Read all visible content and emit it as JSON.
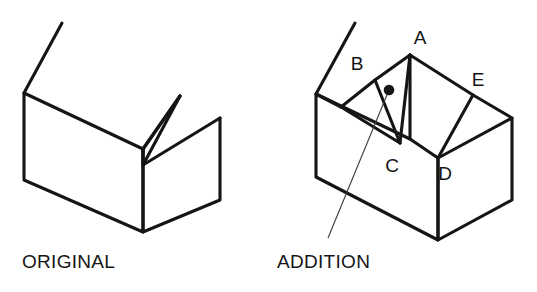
{
  "figure": {
    "background_color": "#ffffff",
    "line_color": "#151515",
    "width": 537,
    "height": 292
  },
  "panels": [
    {
      "id": "original",
      "caption": "ORIGINAL",
      "caption_x": 22,
      "caption_y": 268,
      "description": "Simple gable-roof house drawn in isometric projection",
      "shapes": {
        "roof_left_plane": "62,23 24,93 143,149 180,96",
        "roof_right_plane": "180,96 143,149 143,165 220,118",
        "left_wall": "24,93 24,180 143,232 143,149",
        "right_wall": "143,149 143,232 220,200 220,118",
        "gable_edge": "180,96 143,165"
      }
    },
    {
      "id": "addition",
      "caption": "ADDITION",
      "caption_x": 277,
      "caption_y": 268,
      "description": "Same house with a shed/gable addition cut into the front roof slope",
      "shapes": {
        "roof_left_plane": "355,23 316,94 410,139 410,55",
        "roof_right_plane": "410,55 473,95 438,158 410,139",
        "left_wall": "316,94 316,177 438,240 438,158",
        "right_wall": "438,158 438,240 512,200 512,118",
        "right_roof_far": "473,95 512,118 438,158",
        "addition_face_ab": "410,55 375,80 400,143",
        "addition_face_bc": "375,80 341,107 400,143",
        "addition_ridge_ac": "410,55 400,143",
        "valley_left": "341,107 316,94"
      },
      "leader_line": {
        "from_x": 389,
        "from_y": 90,
        "to_x": 328,
        "to_y": 238
      },
      "marker_dot": {
        "x": 389,
        "y": 90,
        "radius": 5.3
      }
    }
  ],
  "vertex_labels": [
    {
      "name": "A",
      "x": 420,
      "y": 44,
      "point_x": 410,
      "point_y": 55
    },
    {
      "name": "B",
      "x": 357,
      "y": 70,
      "point_x": 375,
      "point_y": 80
    },
    {
      "name": "C",
      "x": 392,
      "y": 172,
      "point_x": 400,
      "point_y": 143
    },
    {
      "name": "D",
      "x": 445,
      "y": 180,
      "point_x": 438,
      "point_y": 158
    },
    {
      "name": "E",
      "x": 478,
      "y": 86,
      "point_x": 473,
      "point_y": 95
    }
  ]
}
